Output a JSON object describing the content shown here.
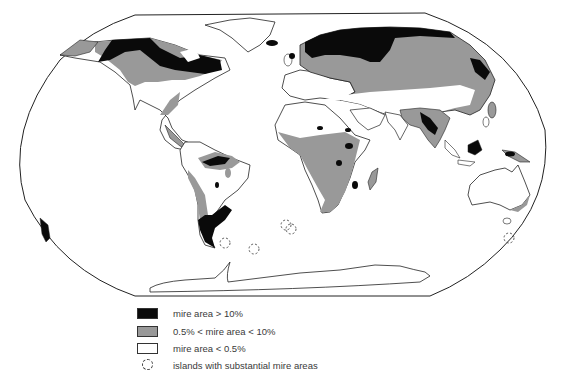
{
  "map": {
    "projection": "world map (rounded equal-area frame)",
    "colors": {
      "high": "#0a0a0a",
      "medium": "#999999",
      "low": "#ffffff",
      "outline": "#222222"
    }
  },
  "legend": {
    "items": [
      {
        "symbol": "black-fill",
        "label": "mire area > 10%"
      },
      {
        "symbol": "grey-fill",
        "label": "0.5% < mire area < 10%"
      },
      {
        "symbol": "white-fill",
        "label": "mire area < 0.5%"
      },
      {
        "symbol": "dashed-circle",
        "label": "islands with substantial mire areas"
      }
    ]
  }
}
